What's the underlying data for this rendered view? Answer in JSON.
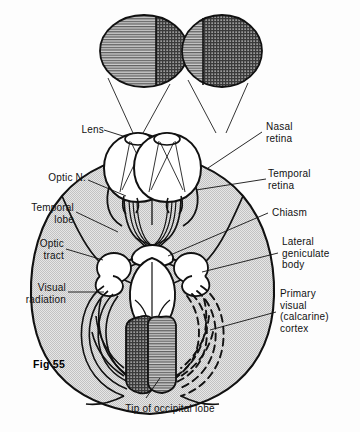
{
  "figure": {
    "number": "Fig 55",
    "caption": "Tip of occipital lobe"
  },
  "labels": {
    "lens": "Lens",
    "optic_n": "Optic N.",
    "temporal_lobe": "Temporal\nlobe",
    "optic_tract": "Optic\ntract",
    "visual_radiation": "Visual\nradiation",
    "nasal_retina": "Nasal\nretina",
    "temporal_retina": "Temporal\nretina",
    "chiasm": "Chiasm",
    "lateral_geniculate_body": "Lateral\ngeniculate\nbody",
    "primary_visual_cortex": "Primary\nvisual\n(calcarine)\ncortex"
  },
  "visual_fields": {
    "left_eye": {
      "name": "left visual field disc",
      "left_half_pattern": "horizontal-lines",
      "right_half_pattern": "crosshatch",
      "split_fraction": 0.63
    },
    "right_eye": {
      "name": "right visual field disc",
      "left_half_pattern": "horizontal-lines",
      "right_half_pattern": "crosshatch",
      "split_fraction": 0.34
    }
  },
  "occipital_tips": {
    "left_tip_pattern": "crosshatch",
    "right_tip_pattern": "horizontal-lines"
  },
  "colors": {
    "ink": "#111111",
    "paper": "#fdfdfd",
    "brain_fill": "#d9d9d9",
    "pattern_light": "#b9b9b9",
    "pattern_dark": "#6a6a6a",
    "white_fill": "#ffffff"
  }
}
